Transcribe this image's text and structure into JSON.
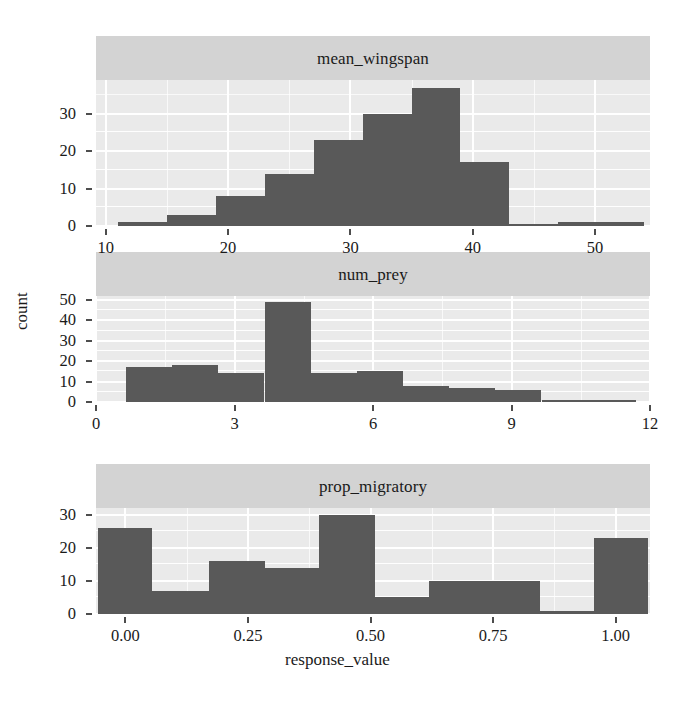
{
  "figure": {
    "x_axis_title": "response_value",
    "y_axis_title": "count",
    "strip_background_color": "#d3d3d3",
    "panel_background_color": "#eaeaea",
    "bar_color": "#595959",
    "gridline_color": "#ffffff"
  },
  "chart_data": [
    {
      "type": "bar",
      "title": "mean_wingspan",
      "subtitle": "",
      "xlabel": "response_value",
      "ylabel": "count",
      "xlim": [
        9.2,
        54.5
      ],
      "ylim": [
        0,
        39
      ],
      "grid": true,
      "legend": "none",
      "xticks": [
        10,
        20,
        30,
        40,
        50
      ],
      "xtick_labels": [
        "10",
        "20",
        "30",
        "40",
        "50"
      ],
      "yticks": [
        0,
        10,
        20,
        30
      ],
      "ytick_labels": [
        "0",
        "10",
        "20",
        "30"
      ],
      "bin_edges": [
        11.0,
        15.0,
        19.0,
        23.0,
        27.0,
        31.0,
        35.0,
        39.0,
        43.0,
        47.0,
        51.0,
        54.0
      ],
      "categories": [
        "11-15",
        "15-19",
        "19-23",
        "23-27",
        "27-31",
        "31-35",
        "35-39",
        "39-43",
        "43-47",
        "47-51",
        "51-54"
      ],
      "values": [
        1,
        3,
        8,
        14,
        23,
        30,
        37,
        17,
        0,
        1,
        1
      ]
    },
    {
      "type": "bar",
      "title": "num_prey",
      "subtitle": "",
      "xlabel": "response_value",
      "ylabel": "count",
      "xlim": [
        0.0,
        12.0
      ],
      "ylim": [
        0,
        52
      ],
      "grid": true,
      "legend": "none",
      "xticks": [
        0,
        3,
        6,
        9,
        12
      ],
      "xtick_labels": [
        "0",
        "3",
        "6",
        "9",
        "12"
      ],
      "yticks": [
        0,
        10,
        20,
        30,
        40,
        50
      ],
      "ytick_labels": [
        "0",
        "10",
        "20",
        "30",
        "40",
        "50"
      ],
      "bin_edges": [
        0.65,
        1.65,
        2.65,
        3.65,
        4.65,
        5.65,
        6.65,
        7.65,
        8.65,
        9.65,
        10.65,
        11.7
      ],
      "categories": [
        "0.65-1.65",
        "1.65-2.65",
        "2.65-3.65",
        "3.65-4.65",
        "4.65-5.65",
        "5.65-6.65",
        "6.65-7.65",
        "7.65-8.65",
        "8.65-9.65",
        "9.65-10.65",
        "10.65-11.7"
      ],
      "values": [
        17,
        18,
        14,
        49,
        14,
        15,
        8,
        7,
        6,
        0,
        1
      ]
    },
    {
      "type": "bar",
      "title": "prop_migratory",
      "subtitle": "",
      "xlabel": "response_value",
      "ylabel": "count",
      "xlim": [
        -0.06,
        1.07
      ],
      "ylim": [
        0,
        32
      ],
      "grid": true,
      "legend": "none",
      "xticks": [
        0.0,
        0.25,
        0.5,
        0.75,
        1.0
      ],
      "xtick_labels": [
        "0.00",
        "0.25",
        "0.50",
        "0.75",
        "1.00"
      ],
      "yticks": [
        0,
        10,
        20,
        30
      ],
      "ytick_labels": [
        "0",
        "10",
        "20",
        "30"
      ],
      "bin_edges": [
        -0.055,
        0.055,
        0.17,
        0.285,
        0.395,
        0.51,
        0.62,
        0.735,
        0.845,
        0.955,
        1.065
      ],
      "categories": [
        "-0.055-0.055",
        "0.055-0.17",
        "0.17-0.285",
        "0.285-0.395",
        "0.395-0.51",
        "0.51-0.62",
        "0.62-0.735",
        "0.735-0.845",
        "0.845-0.955",
        "0.955-1.065"
      ],
      "values": [
        26,
        7,
        16,
        14,
        30,
        5,
        10,
        10,
        1,
        23
      ]
    }
  ]
}
